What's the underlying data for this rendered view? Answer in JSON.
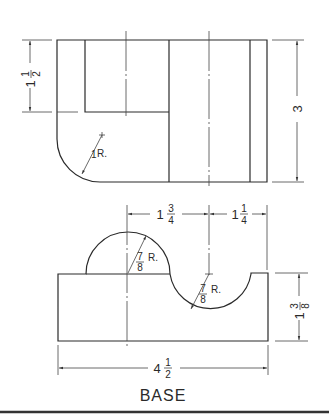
{
  "drawing": {
    "title": "BASE",
    "top_view": {
      "dims": {
        "left_height": {
          "whole": "1",
          "num": "1",
          "den": "2"
        },
        "overall_height": {
          "whole": "3"
        },
        "corner_radius": {
          "whole": "1",
          "suffix": "R."
        }
      }
    },
    "front_view": {
      "dims": {
        "center_spacing": {
          "whole": "1",
          "num": "3",
          "den": "4"
        },
        "right_spacing": {
          "whole": "1",
          "num": "1",
          "den": "4"
        },
        "boss_radius": {
          "num": "7",
          "den": "8",
          "suffix": "R."
        },
        "slot_radius": {
          "num": "7",
          "den": "8",
          "suffix": "R."
        },
        "height": {
          "whole": "1",
          "num": "3",
          "den": "8"
        },
        "overall_width": {
          "whole": "4",
          "num": "1",
          "den": "2"
        }
      }
    }
  }
}
